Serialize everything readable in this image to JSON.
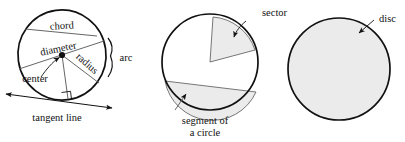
{
  "figure": {
    "background_color": "#ffffff",
    "stroke_color": "#111111",
    "shade_color": "#ebebeb",
    "leader_color": "#666666"
  },
  "panels": [
    {
      "id": "circle-parts",
      "name": "labelled-circle",
      "labels": {
        "chord": "chord",
        "diameter": "diameter",
        "radius": "radius",
        "center": "center",
        "arc": "arc",
        "tangent_line": "tangent line"
      },
      "geometry": {
        "center_x": 62,
        "center_y": 55,
        "radius_x": 44,
        "radius_y": 45,
        "rotation_deg": -8
      }
    },
    {
      "id": "sector-segment",
      "name": "sector-and-segment-circle",
      "labels": {
        "sector": "sector",
        "segment_line1": "segment of",
        "segment_line2": "a circle"
      },
      "geometry": {
        "center_x": 210,
        "center_y": 62,
        "radius": 48
      }
    },
    {
      "id": "disc",
      "name": "filled-disc",
      "labels": {
        "disc": "disc"
      },
      "geometry": {
        "center_x": 339,
        "center_y": 69,
        "radius": 51
      }
    }
  ]
}
